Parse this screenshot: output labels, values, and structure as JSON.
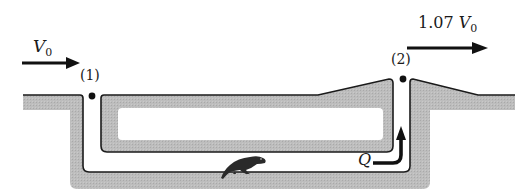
{
  "diagram": {
    "type": "prairie-dog-burrow-ventilation",
    "inlet": {
      "point_label": "(1)",
      "velocity_symbol": "V",
      "velocity_subscript": "0"
    },
    "outlet": {
      "point_label": "(2)",
      "velocity_coefficient": "1.07",
      "velocity_symbol": "V",
      "velocity_subscript": "0"
    },
    "flow": {
      "label": "Q"
    },
    "icons": [
      "wind-arrow-inlet",
      "wind-arrow-outlet",
      "flow-arrow",
      "prairie-dog-icon"
    ],
    "colors": {
      "ground": "#b8b8b8",
      "outline": "#1a1a1a",
      "background": "#ffffff"
    }
  }
}
